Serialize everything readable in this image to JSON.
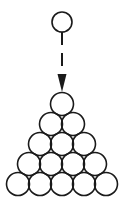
{
  "diagram": {
    "colors": {
      "stroke": "#1a1a1a",
      "fill": "#ffffff",
      "background": "#ffffff"
    },
    "falling_circle": {
      "cx": 62,
      "cy": 22,
      "r": 10
    },
    "arrow": {
      "x": 62,
      "y_start": 32,
      "y_tip": 92,
      "style": "dashed",
      "head": "filled-triangle"
    },
    "stack": {
      "rows": 5,
      "circles_per_row": [
        1,
        2,
        3,
        4,
        5
      ],
      "total_circles": 15,
      "radius": 11.5,
      "h_step": 22,
      "v_step": 20,
      "apex": {
        "cx": 62,
        "cy": 104
      }
    }
  }
}
